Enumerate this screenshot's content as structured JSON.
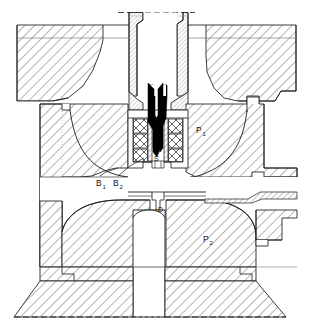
{
  "figure": {
    "type": "engineering-cross-section",
    "width": 312,
    "height": 329,
    "background_color": "#ffffff",
    "line_color": "#1a1a1a",
    "hatch_color": "#555555",
    "solid_fill_color": "#000000"
  },
  "labels": {
    "p1": "P",
    "p1_sub": "1",
    "p2": "P",
    "p2_sub": "2",
    "b1": "B",
    "b1_sub": "1",
    "b2": "B",
    "b2_sub": "2",
    "s": "S",
    "d": "D"
  },
  "parts": {
    "upper_platen_left": "upper-platen-left",
    "upper_platen_right": "upper-platen-right",
    "sprue_bushing": "sprue-bushing",
    "nozzle_tip": "nozzle-tip",
    "valve_needle": "valve-needle",
    "cavity_plate_upper": "cavity-plate-upper",
    "cavity_plate_lower": "cavity-plate-lower",
    "base_platen": "base-platen",
    "ejector_pin": "ejector-pin",
    "insulator_blocks": "insulator-blocks",
    "gate": "gate",
    "runner_flange": "runner-flange"
  }
}
